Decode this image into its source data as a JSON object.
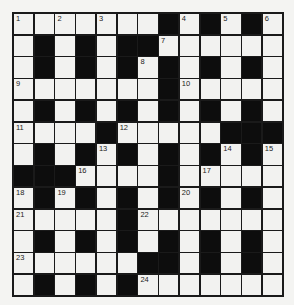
{
  "puzzle": {
    "rows": 13,
    "cols": 13,
    "pattern": [
      "WWWWWWWBWBWBW",
      "WBWBWBBWWWWWW",
      "WBWBWBWBWBWBW",
      "WWWWWWWBWWWWW",
      "WBWBWBWBWBWBW",
      "WWWWBWWWWWBBB",
      "WBWBWBWBWBWBW",
      "BBBWWWWBWWWWW",
      "WBWBWBWBWBWBW",
      "WWWWWBWWWWWWW",
      "WBWBWBWBWBWBW",
      "WWWWWWBBWBWBW",
      "WBWBWBWWWWWWW"
    ],
    "numbers": [
      {
        "row": 0,
        "col": 0,
        "n": "1"
      },
      {
        "row": 0,
        "col": 2,
        "n": "2"
      },
      {
        "row": 0,
        "col": 4,
        "n": "3"
      },
      {
        "row": 0,
        "col": 8,
        "n": "4"
      },
      {
        "row": 0,
        "col": 10,
        "n": "5"
      },
      {
        "row": 0,
        "col": 12,
        "n": "6"
      },
      {
        "row": 1,
        "col": 7,
        "n": "7"
      },
      {
        "row": 2,
        "col": 6,
        "n": "8"
      },
      {
        "row": 3,
        "col": 0,
        "n": "9"
      },
      {
        "row": 3,
        "col": 8,
        "n": "10"
      },
      {
        "row": 5,
        "col": 0,
        "n": "11"
      },
      {
        "row": 5,
        "col": 5,
        "n": "12"
      },
      {
        "row": 6,
        "col": 4,
        "n": "13"
      },
      {
        "row": 6,
        "col": 10,
        "n": "14"
      },
      {
        "row": 6,
        "col": 12,
        "n": "15"
      },
      {
        "row": 7,
        "col": 3,
        "n": "16"
      },
      {
        "row": 7,
        "col": 9,
        "n": "17"
      },
      {
        "row": 8,
        "col": 0,
        "n": "18"
      },
      {
        "row": 8,
        "col": 2,
        "n": "19"
      },
      {
        "row": 8,
        "col": 8,
        "n": "20"
      },
      {
        "row": 9,
        "col": 0,
        "n": "21"
      },
      {
        "row": 9,
        "col": 6,
        "n": "22"
      },
      {
        "row": 11,
        "col": 0,
        "n": "23"
      },
      {
        "row": 12,
        "col": 6,
        "n": "24"
      }
    ],
    "colors": {
      "block": "#0d0d0d",
      "cell": "#f2f2f0",
      "border": "#1a1a1a"
    }
  }
}
